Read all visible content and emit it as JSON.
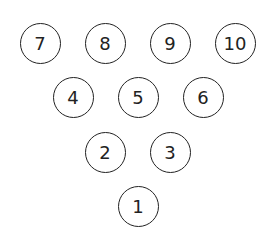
{
  "diagram": {
    "pins": [
      {
        "label": "7",
        "x": 40,
        "y": 43
      },
      {
        "label": "8",
        "x": 105,
        "y": 43
      },
      {
        "label": "9",
        "x": 170,
        "y": 43
      },
      {
        "label": "10",
        "x": 235,
        "y": 43
      },
      {
        "label": "4",
        "x": 73,
        "y": 97
      },
      {
        "label": "5",
        "x": 138,
        "y": 97
      },
      {
        "label": "6",
        "x": 203,
        "y": 97
      },
      {
        "label": "2",
        "x": 105,
        "y": 152
      },
      {
        "label": "3",
        "x": 170,
        "y": 152
      },
      {
        "label": "1",
        "x": 138,
        "y": 206
      }
    ]
  }
}
